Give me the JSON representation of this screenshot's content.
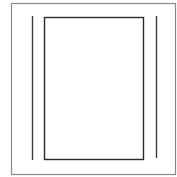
{
  "diagram": {
    "colors": {
      "background": "#ffffff",
      "outer_frame": "#8a8a8a",
      "inner_panel": "#2a2a2a",
      "side_rails": "#3a3a3a"
    },
    "outer_frame": {
      "x": 11,
      "y": 3,
      "width": 164,
      "height": 172
    },
    "inner_panel": {
      "x": 44,
      "y": 17,
      "width": 99,
      "height": 142
    },
    "left_rail": {
      "x": 32,
      "y1": 16,
      "y2": 160
    },
    "right_rail": {
      "x": 156,
      "y1": 16,
      "y2": 158
    }
  }
}
